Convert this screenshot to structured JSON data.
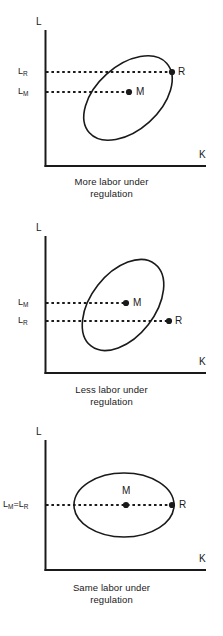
{
  "figure": {
    "type": "diagram",
    "axis_color": "#1a1a1a",
    "curve_color": "#1a1a1a",
    "dashed_color": "#1a1a1a",
    "background": "#ffffff"
  },
  "panels": [
    {
      "id": "panel-more-labor",
      "y_axis_label": "L",
      "x_axis_label": "K",
      "tick_labels": [
        {
          "text": "L",
          "sub": "R",
          "y": 72
        },
        {
          "text": "L",
          "sub": "M",
          "y": 92
        }
      ],
      "points": [
        {
          "name": "M",
          "label": "M",
          "cx": 129,
          "cy": 92,
          "label_side": "right"
        },
        {
          "name": "R",
          "label": "R",
          "cx": 172,
          "cy": 72,
          "label_side": "right"
        }
      ],
      "ellipse": {
        "cx": 128,
        "cy": 98,
        "rx": 52,
        "ry": 32,
        "rotate": -42
      },
      "caption": {
        "line1": "More labor under",
        "line2": "regulation"
      }
    },
    {
      "id": "panel-less-labor",
      "y_axis_label": "L",
      "x_axis_label": "K",
      "tick_labels": [
        {
          "text": "L",
          "sub": "M",
          "y": 91
        },
        {
          "text": "L",
          "sub": "R",
          "y": 109
        }
      ],
      "points": [
        {
          "name": "M",
          "label": "M",
          "cx": 126,
          "cy": 91,
          "label_side": "right"
        },
        {
          "name": "R",
          "label": "R",
          "cx": 169,
          "cy": 109,
          "label_side": "right"
        }
      ],
      "ellipse": {
        "cx": 123,
        "cy": 93,
        "rx": 52,
        "ry": 32,
        "rotate": -52
      },
      "caption": {
        "line1": "Less labor under",
        "line2": "regulation"
      }
    },
    {
      "id": "panel-same-labor",
      "y_axis_label": "L",
      "x_axis_label": "K",
      "tick_labels": [
        {
          "text": "L",
          "sub": "M",
          "eq": "=",
          "text2": "L",
          "sub2": "R",
          "y": 81
        }
      ],
      "points": [
        {
          "name": "M",
          "label": "M",
          "cx": 126,
          "cy": 81,
          "label_side": "above"
        },
        {
          "name": "R",
          "label": "R",
          "cx": 172,
          "cy": 81,
          "label_side": "right"
        }
      ],
      "ellipse": {
        "cx": 124,
        "cy": 81,
        "rx": 50,
        "ry": 32,
        "rotate": 0
      },
      "caption": {
        "line1": "Same labor under",
        "line2": "regulation"
      }
    }
  ]
}
